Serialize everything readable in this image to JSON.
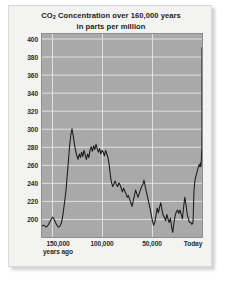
{
  "chart_data": {
    "type": "line",
    "title": "CO2 Concentration over 160,000 years",
    "title_line1_pre": "CO",
    "title_line1_sub": "2",
    "title_line1_post": " Concentration over 160,000 years",
    "title_line2": "in parts per million",
    "xlabel": "",
    "ylabel": "",
    "ylim": [
      180,
      405
    ],
    "xlim": [
      160000,
      0
    ],
    "grid": true,
    "legend": "none",
    "line_color": "#1a1a1a",
    "plot_background": "#a9a9a9",
    "gridline_color": "#e6e6e6",
    "card_background": "#f3f3f1",
    "text_color": "#1d1d1d",
    "y_ticks": [
      200,
      220,
      240,
      260,
      280,
      300,
      320,
      340,
      360,
      380,
      400
    ],
    "y_tick_labels": [
      "200",
      "220",
      "240",
      "260",
      "280",
      "300",
      "320",
      "340",
      "360",
      "380",
      "400"
    ],
    "x_ticks": [
      150000,
      100000,
      50000,
      0
    ],
    "x_tick_labels": [
      "150,000",
      "100,000",
      "50,000",
      "Today"
    ],
    "x_tick_sublabel": "years ago",
    "units": "ppm",
    "x_units": "years before present",
    "series": [
      {
        "name": "CO2 concentration",
        "x": [
          160000,
          158500,
          157000,
          155500,
          154000,
          152500,
          151000,
          149500,
          148000,
          146500,
          145000,
          143500,
          142000,
          140500,
          139000,
          137500,
          136000,
          134800,
          133600,
          132400,
          131200,
          130000,
          128800,
          127600,
          126400,
          125200,
          124000,
          122800,
          121600,
          120400,
          119200,
          118000,
          116800,
          115600,
          114400,
          113200,
          112000,
          110800,
          109600,
          108400,
          107200,
          106000,
          104800,
          103600,
          102400,
          101200,
          100000,
          98800,
          97600,
          96400,
          95200,
          94000,
          92800,
          91600,
          90400,
          89200,
          88000,
          86800,
          85600,
          84400,
          83200,
          82000,
          80800,
          79600,
          78400,
          77200,
          76000,
          74800,
          73600,
          72400,
          71200,
          70000,
          68800,
          67600,
          66400,
          65200,
          64000,
          62800,
          61600,
          60400,
          59200,
          58000,
          56800,
          55600,
          54400,
          53200,
          52000,
          50800,
          49600,
          48400,
          47200,
          46000,
          44800,
          43600,
          42400,
          41200,
          40000,
          38800,
          37600,
          36400,
          35200,
          34000,
          32800,
          31600,
          30400,
          29200,
          28000,
          26800,
          25600,
          24400,
          23200,
          22000,
          20800,
          19600,
          18400,
          17200,
          16000,
          14800,
          13600,
          12400,
          11200,
          10000,
          9000,
          8000,
          7000,
          6000,
          5000,
          4000,
          3000,
          2200,
          1600,
          1100,
          700,
          400,
          200,
          120,
          60,
          20,
          0
        ],
        "values": [
          192,
          193,
          192,
          191,
          193,
          196,
          199,
          202,
          200,
          196,
          193,
          191,
          192,
          196,
          205,
          218,
          232,
          248,
          264,
          281,
          293,
          300,
          292,
          283,
          276,
          270,
          266,
          272,
          268,
          274,
          269,
          276,
          271,
          266,
          272,
          268,
          276,
          280,
          275,
          281,
          277,
          283,
          278,
          274,
          278,
          272,
          276,
          274,
          270,
          276,
          272,
          268,
          260,
          248,
          240,
          236,
          239,
          242,
          238,
          236,
          240,
          238,
          234,
          230,
          234,
          231,
          228,
          224,
          226,
          222,
          218,
          214,
          220,
          226,
          232,
          228,
          224,
          228,
          232,
          236,
          238,
          243,
          236,
          230,
          224,
          218,
          212,
          205,
          198,
          193,
          196,
          204,
          212,
          207,
          213,
          218,
          210,
          204,
          202,
          198,
          205,
          200,
          196,
          201,
          191,
          185,
          196,
          204,
          208,
          210,
          206,
          210,
          205,
          200,
          213,
          224,
          216,
          205,
          200,
          196,
          196,
          194,
          196,
          232,
          243,
          248,
          252,
          256,
          260,
          258,
          262,
          258,
          265,
          272,
          277,
          280,
          296,
          340,
          390
        ]
      }
    ],
    "annotations": [
      {
        "text": "modern spike",
        "value": 390
      }
    ]
  },
  "yaxis": {
    "ticks": [
      {
        "label": "400",
        "value": 400
      },
      {
        "label": "380",
        "value": 380
      },
      {
        "label": "360",
        "value": 360
      },
      {
        "label": "340",
        "value": 340
      },
      {
        "label": "320",
        "value": 320
      },
      {
        "label": "300",
        "value": 300
      },
      {
        "label": "280",
        "value": 280
      },
      {
        "label": "260",
        "value": 260
      },
      {
        "label": "240",
        "value": 240
      },
      {
        "label": "220",
        "value": 220
      },
      {
        "label": "200",
        "value": 200
      }
    ]
  },
  "xaxis": {
    "ticks": [
      {
        "label": "150,000",
        "sub": "years ago",
        "value": 150000
      },
      {
        "label": "100,000",
        "sub": "",
        "value": 100000
      },
      {
        "label": "50,000",
        "sub": "",
        "value": 50000
      },
      {
        "label": "Today",
        "sub": "",
        "value": 0
      }
    ]
  }
}
